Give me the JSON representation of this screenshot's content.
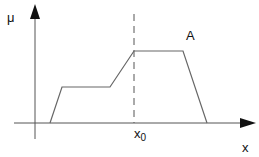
{
  "diagram": {
    "type": "membership-function",
    "labels": {
      "y_axis": "μ",
      "x_axis": "x",
      "set_name": "A",
      "marker": "x",
      "marker_sub": "0"
    },
    "shape_points": [
      [
        50,
        123
      ],
      [
        62,
        87
      ],
      [
        110,
        87
      ],
      [
        134,
        51
      ],
      [
        183,
        51
      ],
      [
        207,
        123
      ]
    ],
    "colors": {
      "axis": "#444444",
      "curve": "#666666",
      "dashed": "#555555",
      "arrow": "#111111"
    }
  }
}
